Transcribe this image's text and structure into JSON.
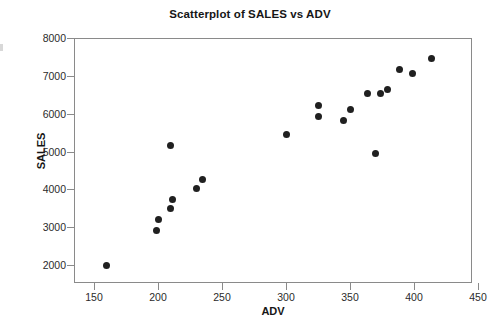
{
  "chart_data": {
    "type": "scatter",
    "title": "Scatterplot of SALES vs ADV",
    "xlabel": "ADV",
    "ylabel": "SALES",
    "xlim": [
      150,
      450
    ],
    "ylim": [
      2000,
      8000
    ],
    "xticks": [
      150,
      200,
      250,
      300,
      350,
      400,
      450
    ],
    "yticks": [
      2000,
      3000,
      4000,
      5000,
      6000,
      7000,
      8000
    ],
    "grid": false,
    "legend": null,
    "marker": {
      "shape": "circle",
      "color": "#202020",
      "size": 7
    },
    "series": [
      {
        "name": "SALES vs ADV",
        "points": [
          {
            "x": 160,
            "y": 2000
          },
          {
            "x": 199,
            "y": 2900
          },
          {
            "x": 200,
            "y": 3200
          },
          {
            "x": 210,
            "y": 3500
          },
          {
            "x": 211,
            "y": 3720
          },
          {
            "x": 210,
            "y": 5170
          },
          {
            "x": 230,
            "y": 4020
          },
          {
            "x": 235,
            "y": 4260
          },
          {
            "x": 300,
            "y": 5460
          },
          {
            "x": 325,
            "y": 5930
          },
          {
            "x": 325,
            "y": 6210
          },
          {
            "x": 345,
            "y": 5820
          },
          {
            "x": 350,
            "y": 6120
          },
          {
            "x": 370,
            "y": 4940
          },
          {
            "x": 364,
            "y": 6520
          },
          {
            "x": 374,
            "y": 6520
          },
          {
            "x": 379,
            "y": 6640
          },
          {
            "x": 389,
            "y": 7160
          },
          {
            "x": 399,
            "y": 7060
          },
          {
            "x": 414,
            "y": 7450
          }
        ]
      }
    ]
  },
  "axes": {
    "x_tick_labels": [
      "150",
      "200",
      "250",
      "300",
      "350",
      "400",
      "450"
    ],
    "y_tick_labels": [
      "2000",
      "3000",
      "4000",
      "5000",
      "6000",
      "7000",
      "8000"
    ],
    "x_axis_title": "ADV",
    "y_axis_title": "SALES"
  },
  "header": {
    "title": "Scatterplot of SALES vs ADV"
  }
}
